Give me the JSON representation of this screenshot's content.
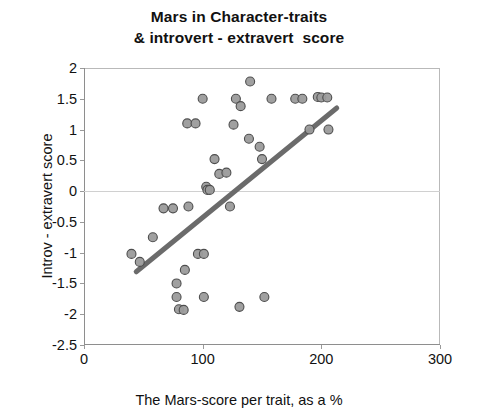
{
  "chart_data": {
    "type": "scatter",
    "title": "Mars in Character-traits & introvert - extravert  score",
    "title_lines": [
      "Mars in Character-traits",
      "& introvert - extravert  score"
    ],
    "xlabel": "The Mars-score per trait, as a %",
    "ylabel": "Introv - extravert score",
    "xlim": [
      0,
      300
    ],
    "ylim": [
      -2.5,
      2
    ],
    "xticks": [
      0,
      100,
      200,
      300
    ],
    "xtick_labels": [
      "0",
      "100",
      "200",
      "300"
    ],
    "yticks": [
      2,
      1.5,
      1,
      0.5,
      0,
      -0.5,
      -1,
      -1.5,
      -2,
      -2.5
    ],
    "ytick_labels": [
      "2",
      "1.5",
      "1",
      "0.5",
      "0",
      "-0.5",
      "-1",
      "-1.5",
      "-2",
      "-2.5"
    ],
    "grid": false,
    "zero_reference_line": 0,
    "legend": null,
    "marker": {
      "shape": "circle",
      "fill_color": "#9b9b9b",
      "edge_color": "#4d4d4d",
      "size_px": 9
    },
    "trendline": {
      "visible": true,
      "color": "#6b6b6b",
      "width_px": 5,
      "x_start": 44,
      "y_start": -1.31,
      "x_end": 213,
      "y_end": 1.35,
      "slope": 0.0157,
      "intercept": -2.0
    },
    "n_points": 41,
    "points": [
      {
        "x": 40,
        "y": -1.02
      },
      {
        "x": 47,
        "y": -1.15
      },
      {
        "x": 58,
        "y": -0.75
      },
      {
        "x": 67,
        "y": -0.28
      },
      {
        "x": 75,
        "y": -0.28
      },
      {
        "x": 78,
        "y": -1.5
      },
      {
        "x": 78,
        "y": -1.72
      },
      {
        "x": 80,
        "y": -1.92
      },
      {
        "x": 84,
        "y": -1.93
      },
      {
        "x": 85,
        "y": -1.28
      },
      {
        "x": 87,
        "y": 1.1
      },
      {
        "x": 88,
        "y": -0.25
      },
      {
        "x": 94,
        "y": 1.1
      },
      {
        "x": 96,
        "y": -1.02
      },
      {
        "x": 100,
        "y": 1.5
      },
      {
        "x": 101,
        "y": -1.02
      },
      {
        "x": 101,
        "y": -1.72
      },
      {
        "x": 103,
        "y": 0.07
      },
      {
        "x": 104,
        "y": 0.02
      },
      {
        "x": 106,
        "y": 0.02
      },
      {
        "x": 110,
        "y": 0.52
      },
      {
        "x": 114,
        "y": 0.28
      },
      {
        "x": 120,
        "y": 0.3
      },
      {
        "x": 123,
        "y": -0.25
      },
      {
        "x": 126,
        "y": 1.08
      },
      {
        "x": 128,
        "y": 1.5
      },
      {
        "x": 131,
        "y": -1.88
      },
      {
        "x": 132,
        "y": 1.38
      },
      {
        "x": 139,
        "y": 0.85
      },
      {
        "x": 140,
        "y": 1.78
      },
      {
        "x": 148,
        "y": 0.72
      },
      {
        "x": 150,
        "y": 0.52
      },
      {
        "x": 152,
        "y": -1.72
      },
      {
        "x": 158,
        "y": 1.5
      },
      {
        "x": 178,
        "y": 1.5
      },
      {
        "x": 184,
        "y": 1.5
      },
      {
        "x": 190,
        "y": 1.0
      },
      {
        "x": 197,
        "y": 1.53
      },
      {
        "x": 200,
        "y": 1.52
      },
      {
        "x": 205,
        "y": 1.52
      },
      {
        "x": 206,
        "y": 1.0
      }
    ]
  }
}
